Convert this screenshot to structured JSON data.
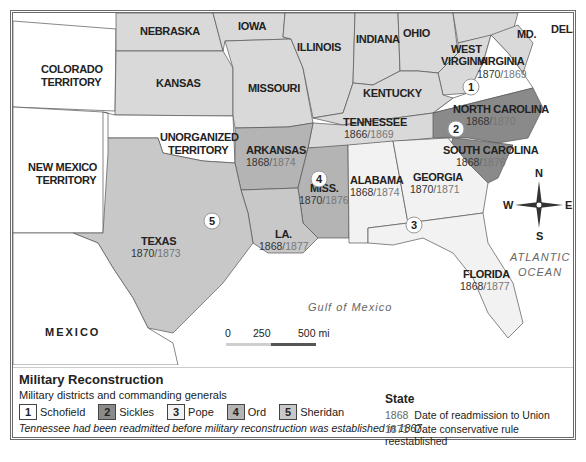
{
  "map": {
    "states": [
      {
        "id": "colorado",
        "label": "COLORADO\nTERRITORY"
      },
      {
        "id": "nebraska",
        "label": "NEBRASKA"
      },
      {
        "id": "iowa",
        "label": "IOWA"
      },
      {
        "id": "illinois",
        "label": "ILLINOIS"
      },
      {
        "id": "indiana",
        "label": "INDIANA"
      },
      {
        "id": "ohio",
        "label": "OHIO"
      },
      {
        "id": "west_virginia",
        "label": "WEST\nVIRGINIA"
      },
      {
        "id": "virginia",
        "label": "VIRGINIA",
        "readmitted": "1870",
        "conservative": "1869"
      },
      {
        "id": "maryland",
        "label": "MD."
      },
      {
        "id": "delaware",
        "label": "DEL."
      },
      {
        "id": "kansas",
        "label": "KANSAS"
      },
      {
        "id": "missouri",
        "label": "MISSOURI"
      },
      {
        "id": "kentucky",
        "label": "KENTUCKY"
      },
      {
        "id": "north_carolina",
        "label": "NORTH CAROLINA",
        "readmitted": "1868",
        "conservative": "1870"
      },
      {
        "id": "tennessee",
        "label": "TENNESSEE",
        "readmitted": "1866",
        "conservative": "1869"
      },
      {
        "id": "south_carolina",
        "label": "SOUTH CAROLINA",
        "readmitted": "1868",
        "conservative": "1876"
      },
      {
        "id": "new_mexico",
        "label": "NEW MEXICO\nTERRITORY"
      },
      {
        "id": "unorganized",
        "label": "UNORGANIZED\nTERRITORY"
      },
      {
        "id": "arkansas",
        "label": "ARKANSAS",
        "readmitted": "1868",
        "conservative": "1874"
      },
      {
        "id": "mississippi",
        "label": "MISS.",
        "readmitted": "1870",
        "conservative": "1876"
      },
      {
        "id": "alabama",
        "label": "ALABAMA",
        "readmitted": "1868",
        "conservative": "1874"
      },
      {
        "id": "georgia",
        "label": "GEORGIA",
        "readmitted": "1870",
        "conservative": "1871"
      },
      {
        "id": "texas",
        "label": "TEXAS",
        "readmitted": "1870",
        "conservative": "1873"
      },
      {
        "id": "louisiana",
        "label": "LA.",
        "readmitted": "1868",
        "conservative": "1877"
      },
      {
        "id": "florida",
        "label": "FLORIDA",
        "readmitted": "1868",
        "conservative": "1877"
      }
    ],
    "labels": {
      "colorado_1": "COLORADO",
      "colorado_2": "TERRITORY",
      "nebraska": "NEBRASKA",
      "iowa": "IOWA",
      "illinois": "ILLINOIS",
      "indiana": "INDIANA",
      "ohio": "OHIO",
      "wv_1": "WEST",
      "wv_2": "VIRGINIA",
      "virginia": "VIRGINIA",
      "md": "MD.",
      "del": "DEL.",
      "kansas": "KANSAS",
      "missouri": "MISSOURI",
      "kentucky": "KENTUCKY",
      "nc": "NORTH CAROLINA",
      "tennessee": "TENNESSEE",
      "sc": "SOUTH CAROLINA",
      "nm_1": "NEW MEXICO",
      "nm_2": "TERRITORY",
      "ut_1": "UNORGANIZED",
      "ut_2": "TERRITORY",
      "arkansas": "ARKANSAS",
      "miss": "MISS.",
      "alabama": "ALABAMA",
      "georgia": "GEORGIA",
      "texas": "TEXAS",
      "la": "LA.",
      "florida": "FLORIDA",
      "mexico": "MEXICO"
    },
    "dates": {
      "virginia": [
        "1870",
        "1869"
      ],
      "nc": [
        "1868",
        "1870"
      ],
      "tennessee": [
        "1866",
        "1869"
      ],
      "sc": [
        "1868",
        "1876"
      ],
      "arkansas": [
        "1868",
        "1874"
      ],
      "miss": [
        "1870",
        "1876"
      ],
      "alabama": [
        "1868",
        "1874"
      ],
      "georgia": [
        "1870",
        "1871"
      ],
      "texas": [
        "1870",
        "1873"
      ],
      "la": [
        "1868",
        "1877"
      ],
      "florida": [
        "1868",
        "1877"
      ]
    },
    "district_markers": [
      "1",
      "2",
      "3",
      "4",
      "5"
    ],
    "water": {
      "gulf": "Gulf of Mexico",
      "atlantic_1": "ATLANTIC",
      "atlantic_2": "OCEAN"
    },
    "compass": {
      "n": "N",
      "s": "S",
      "e": "E",
      "w": "W"
    },
    "scale": {
      "zero": "0",
      "mid": "250",
      "max": "500 mi"
    },
    "colors": {
      "district_1": "#ffffff",
      "district_2": "#8a8a8a",
      "district_3": "#f2f2f2",
      "district_4": "#b4b4b4",
      "district_5": "#c8c8c8",
      "other_state": "#d9d9d9",
      "territory": "#ffffff",
      "water": "#ffffff"
    }
  },
  "legend": {
    "title": "Military Reconstruction",
    "subtitle": "Military districts and commanding generals",
    "districts": [
      {
        "num": "1",
        "general": "Schofield",
        "color": "#ffffff"
      },
      {
        "num": "2",
        "general": "Sickles",
        "color": "#8a8a8a"
      },
      {
        "num": "3",
        "general": "Pope",
        "color": "#f2f2f2"
      },
      {
        "num": "4",
        "general": "Ord",
        "color": "#b4b4b4"
      },
      {
        "num": "5",
        "general": "Sheridan",
        "color": "#c8c8c8"
      }
    ],
    "note": "Tennessee had been readmitted before military reconstruction was established in 1867.",
    "state_key": {
      "title": "State",
      "rows": [
        {
          "year": "1868",
          "desc": "Date of readmission to Union"
        },
        {
          "year": "1871",
          "desc": "Date conservative rule reestablished"
        }
      ]
    }
  }
}
